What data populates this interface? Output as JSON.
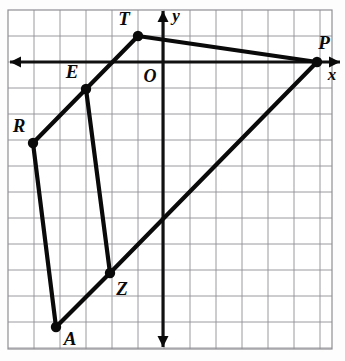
{
  "figure": {
    "kind": "coordinate-grid-polygon",
    "background_color": "#fdfdfd",
    "grid_color": "#8f8f95",
    "ink_color": "#0a0a0a"
  },
  "grid": {
    "cell_size_px": 26,
    "origin_px": {
      "x": 163,
      "y": 62
    },
    "frame_px": {
      "left": 8,
      "top": 10,
      "right": 332,
      "bottom": 349
    },
    "columns": 13,
    "rows": 13
  },
  "axes": {
    "x_axis": {
      "label": "x",
      "label_pos_px": {
        "x": 332,
        "y": 76
      },
      "y_px": 62,
      "start_px": 10,
      "end_px": 340,
      "arrow_left": true,
      "arrow_right": true
    },
    "y_axis": {
      "label": "y",
      "label_pos_px": {
        "x": 176,
        "y": 17
      },
      "x_px": 163,
      "start_px": 11,
      "end_px": 347,
      "arrow_up": true,
      "arrow_down": true
    },
    "origin": {
      "label": "O",
      "label_pos_px": {
        "x": 150,
        "y": 78
      }
    }
  },
  "points": [
    {
      "label": "T",
      "px": {
        "x": 138,
        "y": 36
      },
      "grid": {
        "x": -1,
        "y": 1
      },
      "label_px": {
        "x": 124,
        "y": 21
      }
    },
    {
      "label": "P",
      "px": {
        "x": 317,
        "y": 62
      },
      "grid": {
        "x": 6,
        "y": 0
      },
      "label_px": {
        "x": 324,
        "y": 45
      }
    },
    {
      "label": "E",
      "px": {
        "x": 86,
        "y": 89
      },
      "grid": {
        "x": -3,
        "y": -1
      },
      "label_px": {
        "x": 72,
        "y": 74
      }
    },
    {
      "label": "R",
      "px": {
        "x": 33,
        "y": 143
      },
      "grid": {
        "x": -5,
        "y": -3
      },
      "label_px": {
        "x": 19,
        "y": 128
      }
    },
    {
      "label": "Z",
      "px": {
        "x": 110,
        "y": 273
      },
      "grid": {
        "x": -2,
        "y": -8
      },
      "label_px": {
        "x": 122,
        "y": 291
      }
    },
    {
      "label": "A",
      "px": {
        "x": 56,
        "y": 327
      },
      "grid": {
        "x": -4,
        "y": -10
      },
      "label_px": {
        "x": 70,
        "y": 341
      }
    }
  ],
  "edges": [
    {
      "name": "edge-T-P",
      "from": "T",
      "to": "P"
    },
    {
      "name": "edge-P-Z",
      "from": "P",
      "to": "Z"
    },
    {
      "name": "edge-Z-A",
      "from": "Z",
      "to": "A"
    },
    {
      "name": "edge-A-R",
      "from": "A",
      "to": "R"
    },
    {
      "name": "edge-R-E",
      "from": "R",
      "to": "E"
    },
    {
      "name": "edge-E-T",
      "from": "E",
      "to": "T"
    },
    {
      "name": "edge-E-Z",
      "from": "E",
      "to": "Z"
    }
  ]
}
